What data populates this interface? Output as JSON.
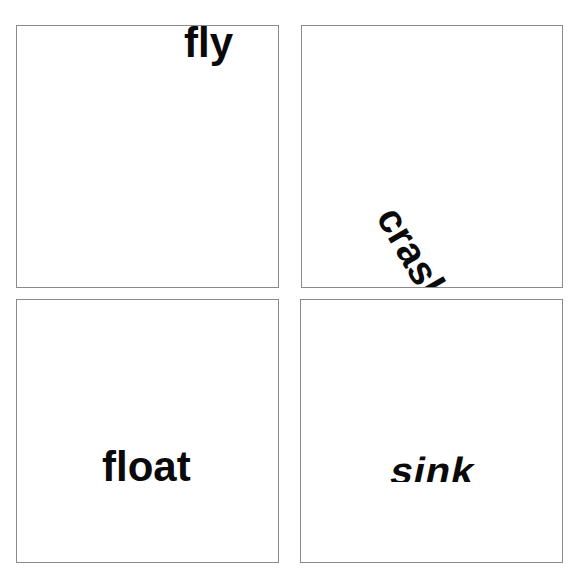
{
  "panels": [
    {
      "id": "fly",
      "word": "fly",
      "effect": "positioned at top edge"
    },
    {
      "id": "crash",
      "word": "crash",
      "effect": "rotated diagonally toward bottom"
    },
    {
      "id": "float",
      "word": "float",
      "effect": "bottom portion clipped as if submerged"
    },
    {
      "id": "sink",
      "word": "sink",
      "effect": "slanted with bottom portion clipped"
    }
  ],
  "colors": {
    "text": "#0a0a0a",
    "border": "#8a8a8a",
    "background": "#ffffff"
  }
}
